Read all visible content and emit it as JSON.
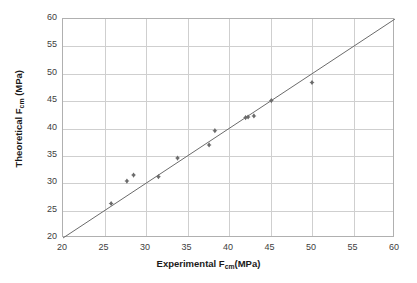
{
  "chart_data": {
    "type": "scatter",
    "title": "",
    "xlabel": "Experimental F",
    "xlabel_sub": "cm",
    "xlabel_tail": "(MPa)",
    "ylabel": "Theoretical F",
    "ylabel_sub": "cm",
    "ylabel_tail": " (MPa)",
    "xlim": [
      20,
      60
    ],
    "ylim": [
      20,
      60
    ],
    "xticks": [
      20,
      25,
      30,
      35,
      40,
      45,
      50,
      55,
      60
    ],
    "yticks": [
      20,
      25,
      30,
      35,
      40,
      45,
      50,
      55,
      60
    ],
    "grid": true,
    "legend": "none",
    "series": [
      {
        "name": "data-points",
        "marker": "diamond",
        "color": "#6b6b6b",
        "points": [
          {
            "x": 25.8,
            "y": 26.3
          },
          {
            "x": 27.7,
            "y": 30.4
          },
          {
            "x": 28.5,
            "y": 31.5
          },
          {
            "x": 31.5,
            "y": 31.2
          },
          {
            "x": 33.8,
            "y": 34.6
          },
          {
            "x": 37.6,
            "y": 37.0
          },
          {
            "x": 38.3,
            "y": 39.6
          },
          {
            "x": 42.0,
            "y": 42.0
          },
          {
            "x": 42.3,
            "y": 42.1
          },
          {
            "x": 43.0,
            "y": 42.3
          },
          {
            "x": 45.1,
            "y": 45.1
          },
          {
            "x": 50.0,
            "y": 48.4
          }
        ]
      }
    ],
    "reference_line": {
      "name": "equality-line",
      "color": "#6b6b6b",
      "from": {
        "x": 20,
        "y": 20
      },
      "to": {
        "x": 60,
        "y": 60
      }
    }
  },
  "axes": {
    "x_tick_labels": [
      "20",
      "25",
      "30",
      "35",
      "40",
      "45",
      "50",
      "55",
      "60"
    ],
    "y_tick_labels": [
      "20",
      "25",
      "30",
      "35",
      "40",
      "45",
      "50",
      "55",
      "60"
    ]
  },
  "colors": {
    "marker": "#6b6b6b",
    "line": "#6b6b6b",
    "grid": "#cfcfcf",
    "frame": "#b0b0b0",
    "text": "#1a1a1a"
  }
}
